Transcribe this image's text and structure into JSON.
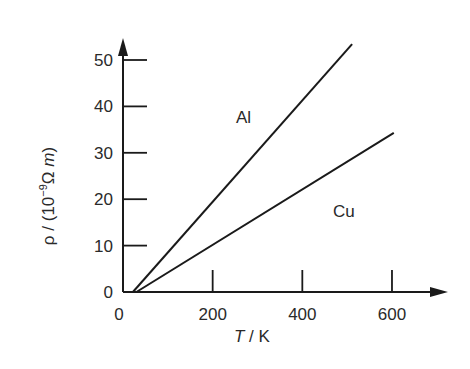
{
  "chart_data": {
    "type": "line",
    "title": "",
    "xlabel": "T / K",
    "ylabel": "ρ / (10⁻⁹ Ω m)",
    "xlim": [
      0,
      700
    ],
    "ylim": [
      0,
      55
    ],
    "x_ticks": [
      0,
      200,
      400,
      600
    ],
    "y_ticks": [
      0,
      10,
      20,
      30,
      40,
      50
    ],
    "x_tick_labels": [
      "0",
      "200",
      "400",
      "600"
    ],
    "y_tick_labels": [
      "0",
      "10",
      "20",
      "30",
      "40",
      "50"
    ],
    "grid": false,
    "legend": "inline labels",
    "series": [
      {
        "name": "Al",
        "x": [
          22,
          511
        ],
        "y": [
          0,
          53.4
        ]
      },
      {
        "name": "Cu",
        "x": [
          30,
          604
        ],
        "y": [
          0,
          34.3
        ]
      }
    ]
  },
  "labels": {
    "xlabel_italic": "T",
    "xlabel_rest": " / K",
    "ylabel_prefix": "ρ / (10",
    "ylabel_exp": "−9",
    "ylabel_mid": "Ω ",
    "ylabel_italic": "m",
    "ylabel_suffix": ")",
    "series_al": "Al",
    "series_cu": "Cu",
    "origin_x": "0",
    "origin_y": "0"
  }
}
